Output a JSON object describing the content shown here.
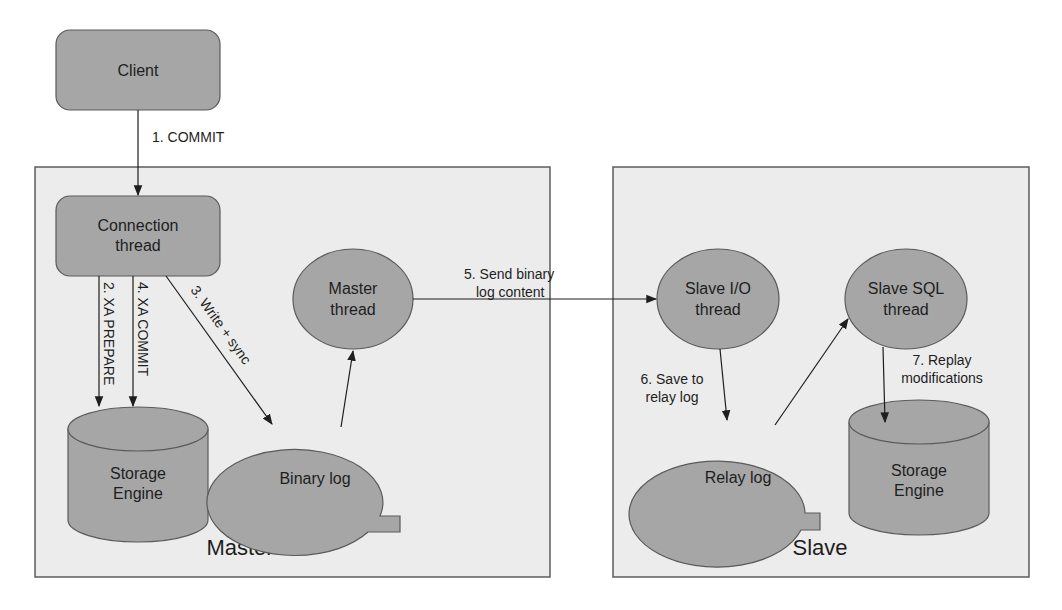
{
  "diagram": {
    "colors": {
      "node_fill": "#a6a6a6",
      "node_stroke": "#5a5a5a",
      "group_fill": "#ececec",
      "group_stroke": "#5c5c5c",
      "edge": "#1e1e1e",
      "text": "#1e1e1e"
    },
    "groups": {
      "master": {
        "label": "Master"
      },
      "slave": {
        "label": "Slave"
      }
    },
    "nodes": {
      "client": {
        "label": "Client",
        "shape": "rounded-rect"
      },
      "connection_thread": {
        "line1": "Connection",
        "line2": "thread",
        "shape": "rounded-rect"
      },
      "master_thread": {
        "line1": "Master",
        "line2": "thread",
        "shape": "ellipse"
      },
      "master_storage": {
        "line1": "Storage",
        "line2": "Engine",
        "shape": "cylinder"
      },
      "binary_log": {
        "label": "Binary log",
        "shape": "callout-ellipse"
      },
      "slave_io_thread": {
        "line1": "Slave I/O",
        "line2": "thread",
        "shape": "ellipse"
      },
      "slave_sql_thread": {
        "line1": "Slave SQL",
        "line2": "thread",
        "shape": "ellipse"
      },
      "relay_log": {
        "label": "Relay log",
        "shape": "callout-ellipse"
      },
      "slave_storage": {
        "line1": "Storage",
        "line2": "Engine",
        "shape": "cylinder"
      }
    },
    "edges": [
      {
        "id": "e1",
        "from": "client",
        "to": "connection_thread",
        "label": "1. COMMIT"
      },
      {
        "id": "e2",
        "from": "connection_thread",
        "to": "master_storage",
        "label": "2. XA PREPARE"
      },
      {
        "id": "e3",
        "from": "connection_thread",
        "to": "binary_log",
        "label": "3. Write + sync"
      },
      {
        "id": "e4",
        "from": "connection_thread",
        "to": "master_storage",
        "label": "4. XA COMMIT"
      },
      {
        "id": "e5",
        "from": "master_thread",
        "to": "slave_io_thread",
        "line1": "5. Send binary",
        "line2": "log content"
      },
      {
        "id": "e6",
        "from": "slave_io_thread",
        "to": "relay_log",
        "line1": "6. Save to",
        "line2": "relay log"
      },
      {
        "id": "e7",
        "from": "slave_sql_thread",
        "to": "slave_storage",
        "line1": "7. Replay",
        "line2": "modifications"
      },
      {
        "id": "e8",
        "from": "binary_log",
        "to": "master_thread",
        "label": ""
      },
      {
        "id": "e9",
        "from": "relay_log",
        "to": "slave_sql_thread",
        "label": ""
      }
    ]
  }
}
